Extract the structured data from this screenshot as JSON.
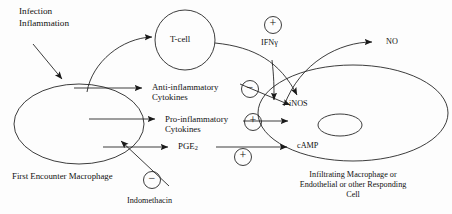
{
  "figure": {
    "type": "biological-signaling-diagram",
    "background_color": "#fdfdfd",
    "stroke_color": "#1a1a1a"
  },
  "stimulus": {
    "line1": "Infection",
    "line2": "Inflammation"
  },
  "cells": {
    "macrophage": {
      "caption": "First Encounter Macrophage"
    },
    "tcell": {
      "label": "T-cell"
    },
    "responding": {
      "caption_line1": "Infiltrating Macrophage or",
      "caption_line2": "Endothelial or other Responding",
      "caption_line3": "Cell"
    }
  },
  "mediators": {
    "anti_inflammatory_line1": "Anti-inflammatory",
    "anti_inflammatory_line2": "Cytokines",
    "pro_inflammatory_line1": "Pro-inflammatory",
    "pro_inflammatory_line2": "Cytokines",
    "pge2_base": "PGE",
    "pge2_sub": "2",
    "ifng": "IFNγ",
    "indomethacin": "Indomethacin"
  },
  "products": {
    "inos": "iNOS",
    "camp": "cAMP",
    "no": "NO"
  },
  "signs": {
    "ifng_plus": "+",
    "anti_inflammatory_minus": "−",
    "pro_inflammatory_plus": "+",
    "pge2_plus": "+",
    "indomethacin_minus": "−"
  }
}
